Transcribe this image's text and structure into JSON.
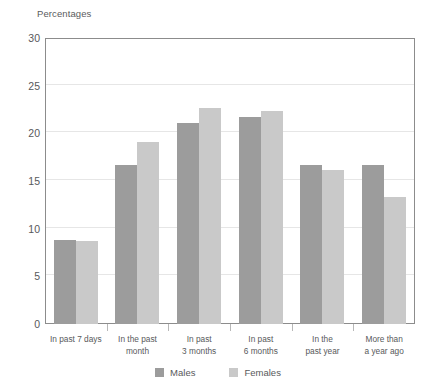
{
  "chart_data": {
    "type": "bar",
    "title": "Percentages",
    "xlabel": "",
    "ylabel": "Percentages",
    "ylim": [
      0,
      30
    ],
    "ytick_step": 5,
    "yticks": [
      30,
      25,
      20,
      15,
      10,
      5,
      0
    ],
    "grid": true,
    "legend_position": "bottom",
    "categories": [
      "In past 7 days",
      "In the past\nmonth",
      "In past\n3 months",
      "In past\n6 months",
      "In the\npast year",
      "More than\na year ago"
    ],
    "series": [
      {
        "name": "Males",
        "color": "#9c9c9c",
        "values": [
          8.8,
          16.7,
          21.1,
          21.7,
          16.7,
          16.7
        ]
      },
      {
        "name": "Females",
        "color": "#c9c9c9",
        "values": [
          8.7,
          19.1,
          22.7,
          22.3,
          16.2,
          13.3
        ]
      }
    ]
  },
  "legend": {
    "items": [
      {
        "label": "Males"
      },
      {
        "label": "Females"
      }
    ]
  },
  "colors": {
    "males": "#9c9c9c",
    "females": "#c9c9c9",
    "gridline": "#e6e6e6",
    "frame": "#8c8c8c",
    "text": "#58595b"
  }
}
